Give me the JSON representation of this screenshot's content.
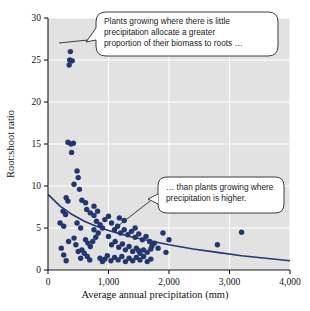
{
  "chart_data": {
    "type": "scatter",
    "title": "",
    "xlabel": "Average annual precipitation (mm)",
    "ylabel": "Root:shoot ratio",
    "xlim": [
      0,
      4000
    ],
    "ylim": [
      0,
      30
    ],
    "xticks": [
      0,
      1000,
      2000,
      3000,
      4000
    ],
    "xtick_labels": [
      "0",
      "1,000",
      "2,000",
      "3,000",
      "4,000"
    ],
    "yticks": [
      0,
      5,
      10,
      15,
      20,
      25,
      30
    ],
    "ytick_labels": [
      "0",
      "5",
      "10",
      "15",
      "20",
      "25",
      "30"
    ],
    "grid": true,
    "grid_color": "#ffffff",
    "plot_bg": "#e2e2e2",
    "point_color": "#23366e",
    "line_color": "#24376f",
    "legend": null,
    "points": [
      [
        370,
        26.0
      ],
      [
        360,
        25.0
      ],
      [
        400,
        24.9
      ],
      [
        350,
        24.4
      ],
      [
        330,
        15.2
      ],
      [
        420,
        15.1
      ],
      [
        380,
        15.0
      ],
      [
        390,
        14.0
      ],
      [
        480,
        11.8
      ],
      [
        500,
        11.0
      ],
      [
        430,
        10.2
      ],
      [
        520,
        9.6
      ],
      [
        300,
        8.6
      ],
      [
        330,
        8.2
      ],
      [
        560,
        8.3
      ],
      [
        620,
        8.0
      ],
      [
        250,
        7.0
      ],
      [
        290,
        6.6
      ],
      [
        640,
        7.2
      ],
      [
        700,
        6.8
      ],
      [
        200,
        5.6
      ],
      [
        260,
        5.2
      ],
      [
        480,
        5.6
      ],
      [
        540,
        5.0
      ],
      [
        760,
        6.5
      ],
      [
        800,
        5.8
      ],
      [
        860,
        5.4
      ],
      [
        900,
        5.0
      ],
      [
        1000,
        6.4
      ],
      [
        1050,
        5.6
      ],
      [
        1100,
        4.8
      ],
      [
        1150,
        5.2
      ],
      [
        1200,
        4.4
      ],
      [
        1260,
        4.8
      ],
      [
        1320,
        4.2
      ],
      [
        1380,
        4.6
      ],
      [
        1440,
        3.9
      ],
      [
        1500,
        4.3
      ],
      [
        1560,
        3.6
      ],
      [
        1620,
        4.0
      ],
      [
        1680,
        3.4
      ],
      [
        1720,
        2.9
      ],
      [
        1760,
        3.2
      ],
      [
        1820,
        2.6
      ],
      [
        620,
        3.6
      ],
      [
        660,
        3.2
      ],
      [
        700,
        2.8
      ],
      [
        740,
        3.4
      ],
      [
        560,
        2.4
      ],
      [
        600,
        2.0
      ],
      [
        650,
        1.6
      ],
      [
        690,
        1.2
      ],
      [
        430,
        3.8
      ],
      [
        460,
        3.0
      ],
      [
        500,
        2.2
      ],
      [
        540,
        1.4
      ],
      [
        220,
        2.6
      ],
      [
        260,
        1.8
      ],
      [
        300,
        1.1
      ],
      [
        340,
        3.4
      ],
      [
        860,
        1.4
      ],
      [
        900,
        1.0
      ],
      [
        940,
        1.3
      ],
      [
        980,
        1.7
      ],
      [
        1040,
        1.1
      ],
      [
        1100,
        1.5
      ],
      [
        1160,
        1.2
      ],
      [
        1220,
        1.6
      ],
      [
        1280,
        1.0
      ],
      [
        1340,
        1.4
      ],
      [
        1400,
        1.1
      ],
      [
        1460,
        1.5
      ],
      [
        1520,
        1.2
      ],
      [
        1580,
        1.6
      ],
      [
        1640,
        1.0
      ],
      [
        1700,
        1.3
      ],
      [
        1280,
        2.4
      ],
      [
        1340,
        2.8
      ],
      [
        1400,
        2.2
      ],
      [
        1460,
        2.6
      ],
      [
        1520,
        2.0
      ],
      [
        1580,
        2.4
      ],
      [
        1640,
        2.1
      ],
      [
        1700,
        2.5
      ],
      [
        1050,
        3.0
      ],
      [
        1110,
        3.4
      ],
      [
        1170,
        2.7
      ],
      [
        1230,
        3.1
      ],
      [
        790,
        3.9
      ],
      [
        830,
        4.4
      ],
      [
        760,
        4.8
      ],
      [
        1900,
        4.4
      ],
      [
        2000,
        3.6
      ],
      [
        1950,
        2.1
      ],
      [
        2800,
        3.0
      ],
      [
        3200,
        4.5
      ],
      [
        1180,
        6.2
      ],
      [
        1260,
        5.9
      ],
      [
        760,
        7.6
      ],
      [
        820,
        7.0
      ],
      [
        940,
        6.0
      ],
      [
        1000,
        4.0
      ],
      [
        1440,
        5.0
      ],
      [
        1500,
        2.3
      ]
    ],
    "trend_line": {
      "description": "declining curve",
      "points": [
        [
          0,
          9.0
        ],
        [
          200,
          7.6
        ],
        [
          400,
          6.6
        ],
        [
          600,
          5.8
        ],
        [
          800,
          5.2
        ],
        [
          1000,
          4.7
        ],
        [
          1200,
          4.3
        ],
        [
          1400,
          3.9
        ],
        [
          1600,
          3.6
        ],
        [
          1800,
          3.3
        ],
        [
          2000,
          3.0
        ],
        [
          2400,
          2.5
        ],
        [
          2800,
          2.1
        ],
        [
          3200,
          1.7
        ],
        [
          3600,
          1.4
        ],
        [
          4000,
          1.1
        ]
      ]
    },
    "annotations": [
      {
        "id": "callout-low-precipitation",
        "text": "Plants growing where there is little precipitation allocate a greater proportion of their biomass to roots …",
        "lines": [
          "Plants growing where there is little",
          "precipitation allocate a greater",
          "proportion of their biomass to roots …"
        ],
        "points_to": [
          400,
          25.5
        ]
      },
      {
        "id": "callout-high-precipitation",
        "text": "… than plants growing where precipitation is higher.",
        "lines": [
          "… than plants growing where",
          "precipitation is higher."
        ],
        "points_to": [
          800,
          5.5
        ]
      }
    ]
  }
}
